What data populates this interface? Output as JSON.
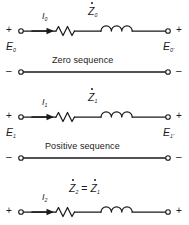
{
  "figure": {
    "type": "circuit-diagram",
    "line_color": "#1a1a1a",
    "background": "#ffffff"
  },
  "circuits": [
    {
      "id": "zero-sequence",
      "name": "Zero sequence",
      "current_label": "I",
      "current_sub": "0",
      "impedance_label": "Z",
      "impedance_sub": "0",
      "impedance_accent": "dot",
      "source_voltage": "E",
      "source_voltage_sub": "0",
      "load_voltage": "E",
      "load_voltage_sub": "0",
      "load_voltage_prime": "'",
      "top_left_sign": "+",
      "top_right_sign": "+",
      "bottom_left_sign": "–",
      "bottom_right_sign": "–",
      "elements": [
        "terminal",
        "current-arrow",
        "resistor",
        "inductor",
        "terminal"
      ]
    },
    {
      "id": "positive-sequence",
      "name": "Positive sequence",
      "current_label": "I",
      "current_sub": "1",
      "impedance_label": "Z",
      "impedance_sub": "1",
      "impedance_accent": "dot",
      "source_voltage": "E",
      "source_voltage_sub": "1",
      "load_voltage": "E",
      "load_voltage_sub": "1",
      "load_voltage_prime": "'",
      "top_left_sign": "+",
      "top_right_sign": "+",
      "bottom_left_sign": "–",
      "bottom_right_sign": "–",
      "elements": [
        "terminal",
        "current-arrow",
        "resistor",
        "inductor",
        "terminal"
      ]
    },
    {
      "id": "negative-sequence",
      "name": "",
      "current_label": "I",
      "current_sub": "2",
      "impedance_label": "Z",
      "impedance_sub": "2",
      "impedance_accent": "dot",
      "impedance_equation_operator": "=",
      "impedance_equals_label": "Z",
      "impedance_equals_sub": "1",
      "impedance_equals_accent": "dot",
      "top_left_sign": "+",
      "top_right_sign": "+",
      "elements": [
        "terminal",
        "current-arrow",
        "resistor",
        "inductor",
        "terminal"
      ]
    }
  ]
}
